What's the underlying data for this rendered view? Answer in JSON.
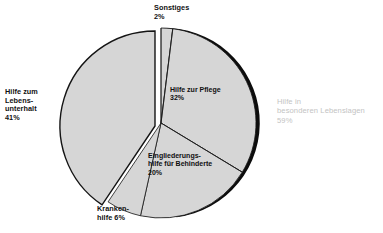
{
  "chart_data": {
    "type": "pie",
    "title": "",
    "subtitle": "",
    "xlabel": "",
    "ylabel": "",
    "legend_position": "none",
    "grid": false,
    "unit": "%",
    "categories": [
      "Sonstiges",
      "Hilfe zur Pflege",
      "Eingliederungshilfe für Behinderte",
      "Krankenhilfe",
      "Hilfe zum Lebensunterhalt"
    ],
    "values": [
      2,
      32,
      20,
      6,
      41
    ],
    "groups": [
      {
        "name": "Hilfe in besonderen Lebenslagen",
        "value": 59,
        "members": [
          "Sonstiges",
          "Hilfe zur Pflege",
          "Eingliederungshilfe für Behinderte",
          "Krankenhilfe"
        ]
      },
      {
        "name": "Hilfe zum Lebensunterhalt",
        "value": 41,
        "members": [
          "Hilfe zum Lebensunterhalt"
        ]
      }
    ],
    "slice_fill": "#d6d6d6",
    "slice_stroke": "#141414",
    "shadow_color": "#000000",
    "exploded_slice": "Hilfe zum Lebensunterhalt"
  },
  "labels": {
    "sonstiges": "Sonstiges\n2%",
    "lebensunterhalt": "Hilfe zum\nLebens-\nunterhalt\n41%",
    "pflege": "Hilfe zur Pflege\n32%",
    "eingliederung": "Eingliederungs-\nhilfe für Behinderte\n20%",
    "kranken": "Kranken-\nhilfe 6%",
    "besondere": "Hilfe in\nbesonderen Lebenslagen\n59%"
  },
  "colors": {
    "slice": "#d6d6d6",
    "outline": "#141414",
    "faint_text": "#c3c3c3",
    "text": "#111111",
    "background": "#ffffff"
  }
}
